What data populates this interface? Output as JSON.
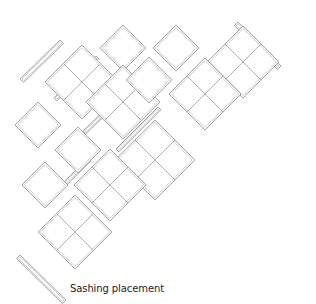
{
  "caption": "Sashing placement",
  "colors": {
    "line": "#8a8a8a",
    "inner": "#a8a8a8",
    "background": "#ffffff",
    "text": "#222222"
  },
  "blocks": [
    {
      "id": "b1",
      "cx": 82,
      "cy": 82,
      "h": 37,
      "type": "four-patch",
      "sash": "nw"
    },
    {
      "id": "b2",
      "cx": 123,
      "cy": 48,
      "h": 23,
      "type": "plain",
      "sash": "ne"
    },
    {
      "id": "b3",
      "cx": 176,
      "cy": 48,
      "h": 23,
      "type": "plain",
      "sash": "ne"
    },
    {
      "id": "b4",
      "cx": 243,
      "cy": 62,
      "h": 36,
      "type": "four-patch",
      "sash": "se"
    },
    {
      "id": "b5",
      "cx": 123,
      "cy": 102,
      "h": 37,
      "type": "four-patch",
      "sash": "sw"
    },
    {
      "id": "b6",
      "cx": 149,
      "cy": 80,
      "h": 23,
      "type": "plain",
      "sash": "ne"
    },
    {
      "id": "b7",
      "cx": 205,
      "cy": 94,
      "h": 36,
      "type": "four-patch",
      "sash": "se"
    },
    {
      "id": "b8",
      "cx": 38,
      "cy": 125,
      "h": 23,
      "type": "plain",
      "sash": "sw"
    },
    {
      "id": "b9",
      "cx": 78,
      "cy": 150,
      "h": 23,
      "type": "plain",
      "sash": "nw"
    },
    {
      "id": "b10",
      "cx": 155,
      "cy": 160,
      "h": 40,
      "type": "four-patch",
      "sash": "nw"
    },
    {
      "id": "b11",
      "cx": 45,
      "cy": 185,
      "h": 23,
      "type": "plain",
      "sash": "sw"
    },
    {
      "id": "b12",
      "cx": 110,
      "cy": 185,
      "h": 36,
      "type": "four-patch",
      "sash": "nw"
    },
    {
      "id": "b13",
      "cx": 75,
      "cy": 232,
      "h": 37,
      "type": "four-patch",
      "sash": "nw"
    }
  ],
  "strips": [
    {
      "id": "s1",
      "x1": 20,
      "y1": 79,
      "x2": 60,
      "y2": 40,
      "w": 5
    },
    {
      "id": "s2",
      "x1": 238,
      "y1": 22,
      "x2": 281,
      "y2": 66,
      "w": 5
    },
    {
      "id": "s3",
      "x1": 20,
      "y1": 255,
      "x2": 66,
      "y2": 300,
      "w": 5
    },
    {
      "id": "s4",
      "x1": 54,
      "y1": 98,
      "x2": 96,
      "y2": 56,
      "w": 4
    },
    {
      "id": "s5",
      "x1": 83,
      "y1": 131,
      "x2": 126,
      "y2": 89,
      "w": 4
    },
    {
      "id": "s6",
      "x1": 116,
      "y1": 149,
      "x2": 158,
      "y2": 107,
      "w": 4
    },
    {
      "id": "s7",
      "x1": 46,
      "y1": 200,
      "x2": 88,
      "y2": 158,
      "w": 4
    }
  ]
}
